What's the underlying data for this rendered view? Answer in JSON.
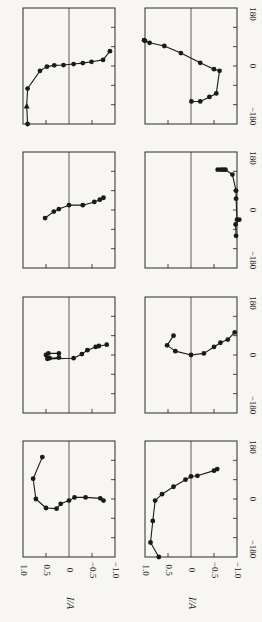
{
  "chart_data": {
    "type": "line",
    "title": "",
    "layout": "8 panels, 4 rows x 2 columns (figure rotated 90 degrees)",
    "ylabel": "I/A",
    "xlabel": "phase angle (degrees)",
    "ia_ticks": [
      "1.0",
      "0.5",
      "0",
      "−0.5",
      "−1.0"
    ],
    "angle_ticks": [
      "180",
      "0",
      "−180"
    ],
    "ia_range": [
      1.0,
      -1.0
    ],
    "angle_range": [
      -180,
      180
    ],
    "grid": false,
    "legend": null,
    "panels": [
      {
        "id": "top-left",
        "start_marker": "triangle",
        "points": [
          [
            0.9,
            -180
          ],
          [
            0.92,
            -124
          ],
          [
            0.9,
            -70
          ],
          [
            0.63,
            -15
          ],
          [
            0.48,
            -2
          ],
          [
            0.32,
            2
          ],
          [
            0.12,
            3
          ],
          [
            -0.1,
            6
          ],
          [
            -0.3,
            9
          ],
          [
            -0.49,
            13
          ],
          [
            -0.74,
            19
          ],
          [
            -0.89,
            46
          ]
        ]
      },
      {
        "id": "top-right",
        "start_marker": "arrow",
        "points": [
          [
            -0.01,
            -110
          ],
          [
            -0.2,
            -110
          ],
          [
            -0.4,
            -96
          ],
          [
            -0.55,
            -85
          ],
          [
            -0.62,
            -15
          ],
          [
            -0.5,
            -10
          ],
          [
            -0.2,
            10
          ],
          [
            0.22,
            40
          ],
          [
            0.58,
            62
          ],
          [
            0.9,
            72
          ],
          [
            1.0,
            78
          ],
          [
            1.02,
            80
          ]
        ]
      },
      {
        "id": "row2-left",
        "start_marker": null,
        "points": [
          [
            0.52,
            -25
          ],
          [
            0.33,
            -5
          ],
          [
            0.22,
            3
          ],
          [
            0.0,
            15
          ],
          [
            -0.3,
            15
          ],
          [
            -0.55,
            25
          ],
          [
            -0.67,
            32
          ],
          [
            -0.75,
            38
          ]
        ]
      },
      {
        "id": "row2-right",
        "start_marker": "arrow",
        "points": [
          [
            -0.58,
            125
          ],
          [
            -0.65,
            125
          ],
          [
            -0.7,
            125
          ],
          [
            -0.75,
            125
          ],
          [
            -0.9,
            110
          ],
          [
            -0.98,
            60
          ],
          [
            -0.98,
            35
          ],
          [
            -1.0,
            -30
          ],
          [
            -1.05,
            -30
          ],
          [
            -0.97,
            -45
          ],
          [
            -0.98,
            -80
          ]
        ]
      },
      {
        "id": "row3-left",
        "start_marker": "arrow",
        "points": [
          [
            0.45,
            5
          ],
          [
            0.22,
            5
          ],
          [
            0.22,
            -8
          ],
          [
            0.42,
            -10
          ],
          [
            0.5,
            0
          ],
          [
            0.47,
            -12
          ],
          [
            -0.1,
            -10
          ],
          [
            -0.28,
            3
          ],
          [
            -0.4,
            15
          ],
          [
            -0.58,
            25
          ],
          [
            -0.65,
            28
          ],
          [
            -0.82,
            32
          ]
        ]
      },
      {
        "id": "row3-right",
        "start_marker": "arrow",
        "points": [
          [
            0.38,
            60
          ],
          [
            0.52,
            30
          ],
          [
            0.34,
            12
          ],
          [
            0.0,
            0
          ],
          [
            -0.28,
            5
          ],
          [
            -0.5,
            25
          ],
          [
            -0.64,
            38
          ],
          [
            -0.8,
            48
          ],
          [
            -0.95,
            70
          ]
        ]
      },
      {
        "id": "bottom-left",
        "start_marker": "arrow",
        "points": [
          [
            0.58,
            130
          ],
          [
            0.78,
            63
          ],
          [
            0.72,
            0
          ],
          [
            0.5,
            -28
          ],
          [
            0.27,
            -30
          ],
          [
            0.18,
            -15
          ],
          [
            0.0,
            -5
          ],
          [
            -0.12,
            5
          ],
          [
            -0.36,
            5
          ],
          [
            -0.68,
            2
          ],
          [
            -0.75,
            -5
          ]
        ]
      },
      {
        "id": "bottom-right",
        "start_marker": "arrow",
        "points": [
          [
            0.7,
            -180
          ],
          [
            0.88,
            -135
          ],
          [
            0.83,
            -68
          ],
          [
            0.78,
            -5
          ],
          [
            0.63,
            15
          ],
          [
            0.38,
            38
          ],
          [
            0.12,
            60
          ],
          [
            0.0,
            70
          ],
          [
            -0.14,
            72
          ],
          [
            -0.5,
            88
          ],
          [
            -0.57,
            93
          ]
        ]
      }
    ]
  },
  "axis_labels": {
    "ia_axis_title": "I/A",
    "ia_ticks": [
      "1.0",
      "0.5",
      "0",
      "−0.5",
      "−1.0"
    ],
    "angle_ticks_top": "180",
    "angle_ticks_mid": "0",
    "angle_ticks_bottom": "−180"
  },
  "colors": {
    "ink": "#1a1a1a",
    "frame": "#2a2a2a",
    "background": "#f7f6f3"
  }
}
